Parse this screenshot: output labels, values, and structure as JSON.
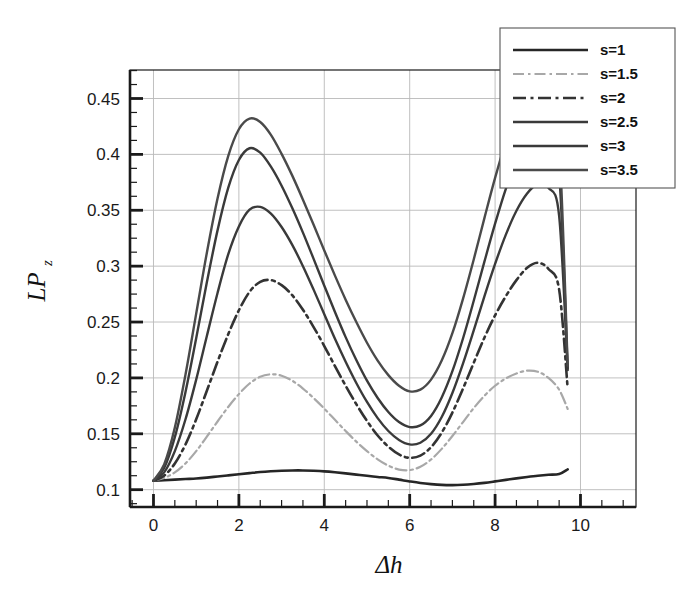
{
  "chart_data": {
    "type": "line",
    "title": "",
    "xlabel": "Δh",
    "ylabel": "LPz",
    "ylabel_base": "LP",
    "ylabel_sub": "z",
    "xlim": [
      -0.55,
      11.3
    ],
    "ylim": [
      0.0845,
      0.4755
    ],
    "xticks": [
      0,
      2,
      4,
      6,
      8,
      10
    ],
    "xtick_labels": [
      "0",
      "2",
      "4",
      "6",
      "8",
      "10"
    ],
    "yticks": [
      0.1,
      0.15,
      0.2,
      0.25,
      0.3,
      0.35,
      0.4,
      0.45
    ],
    "ytick_labels": [
      "0.1",
      "0.15",
      "0.2",
      "0.25",
      "0.3",
      "0.35",
      "0.4",
      "0.45"
    ],
    "x_minor_step": 0.5,
    "y_minor_step": 0.0125,
    "grid": true,
    "grid_color": "#b9b9b9",
    "frame_color": "#1a1a1a",
    "legend_position": "top-right",
    "x": [
      0,
      0.25,
      0.5,
      0.75,
      1,
      1.25,
      1.5,
      1.75,
      2,
      2.25,
      2.5,
      2.75,
      3,
      3.25,
      3.5,
      3.75,
      4,
      4.25,
      4.5,
      4.75,
      5,
      5.25,
      5.5,
      5.75,
      6,
      6.25,
      6.5,
      6.75,
      7,
      7.25,
      7.5,
      7.75,
      8,
      8.25,
      8.5,
      8.75,
      9,
      9.25,
      9.5,
      9.7
    ],
    "series": [
      {
        "name": "s=1",
        "label": "s=1",
        "style": "solid",
        "color": "#262626",
        "width": 2.6,
        "values": [
          0.108,
          0.1085,
          0.109,
          0.1095,
          0.11,
          0.1108,
          0.1118,
          0.1128,
          0.1138,
          0.1148,
          0.1158,
          0.1165,
          0.117,
          0.1172,
          0.1172,
          0.1169,
          0.1164,
          0.1156,
          0.1146,
          0.1135,
          0.1124,
          0.1114,
          0.1105,
          0.109,
          0.1074,
          0.106,
          0.105,
          0.1043,
          0.1041,
          0.1044,
          0.1051,
          0.1061,
          0.1074,
          0.1088,
          0.1101,
          0.1113,
          0.1124,
          0.1133,
          0.114,
          0.1182
        ]
      },
      {
        "name": "s=1.5",
        "label": "s=1.5",
        "style": "dashdot-light",
        "color": "#a8a8a8",
        "width": 2.2,
        "values": [
          0.108,
          0.1105,
          0.1155,
          0.1235,
          0.1345,
          0.1475,
          0.161,
          0.174,
          0.1855,
          0.195,
          0.201,
          0.2032,
          0.202,
          0.1975,
          0.1905,
          0.182,
          0.1725,
          0.1625,
          0.1525,
          0.143,
          0.1345,
          0.1272,
          0.1215,
          0.118,
          0.1175,
          0.1205,
          0.127,
          0.1365,
          0.148,
          0.1605,
          0.173,
          0.184,
          0.193,
          0.1995,
          0.204,
          0.2065,
          0.2055,
          0.2,
          0.1895,
          0.1722
        ]
      },
      {
        "name": "s=2",
        "label": "s=2",
        "style": "dashdot",
        "color": "#333333",
        "width": 2.6,
        "values": [
          0.108,
          0.1125,
          0.1235,
          0.1405,
          0.163,
          0.1885,
          0.2145,
          0.239,
          0.2605,
          0.277,
          0.286,
          0.2875,
          0.283,
          0.274,
          0.261,
          0.2455,
          0.2285,
          0.2105,
          0.193,
          0.1765,
          0.1615,
          0.1485,
          0.1385,
          0.1315,
          0.1285,
          0.1305,
          0.138,
          0.151,
          0.169,
          0.1905,
          0.2135,
          0.236,
          0.256,
          0.273,
          0.2875,
          0.2985,
          0.303,
          0.2975,
          0.279,
          0.1905
        ]
      },
      {
        "name": "s=2.5",
        "label": "s=2.5",
        "style": "solid",
        "color": "#3a3a3a",
        "width": 2.4,
        "values": [
          0.108,
          0.1155,
          0.1345,
          0.163,
          0.1985,
          0.2375,
          0.276,
          0.3105,
          0.3355,
          0.3505,
          0.353,
          0.347,
          0.335,
          0.319,
          0.3,
          0.279,
          0.257,
          0.235,
          0.2145,
          0.1955,
          0.1785,
          0.164,
          0.1525,
          0.1445,
          0.1405,
          0.142,
          0.15,
          0.165,
          0.1865,
          0.213,
          0.2425,
          0.273,
          0.302,
          0.328,
          0.3495,
          0.365,
          0.3735,
          0.37,
          0.345,
          0.207
        ]
      },
      {
        "name": "s=3",
        "label": "s=3",
        "style": "solid",
        "color": "#3a3a3a",
        "width": 2.4,
        "values": [
          0.108,
          0.1195,
          0.147,
          0.1875,
          0.2355,
          0.2855,
          0.332,
          0.37,
          0.395,
          0.4055,
          0.4015,
          0.389,
          0.372,
          0.352,
          0.33,
          0.3065,
          0.2825,
          0.259,
          0.2365,
          0.216,
          0.1975,
          0.182,
          0.1695,
          0.1605,
          0.156,
          0.1575,
          0.166,
          0.1825,
          0.206,
          0.2355,
          0.269,
          0.304,
          0.338,
          0.369,
          0.3945,
          0.413,
          0.4215,
          0.415,
          0.383,
          0.2085
        ]
      },
      {
        "name": "s=3.5",
        "label": "s=3.5",
        "style": "solid",
        "color": "#4a4a4a",
        "width": 2.4,
        "values": [
          0.108,
          0.1225,
          0.1555,
          0.203,
          0.2575,
          0.312,
          0.3605,
          0.3985,
          0.4225,
          0.432,
          0.429,
          0.4175,
          0.4005,
          0.381,
          0.3595,
          0.337,
          0.314,
          0.2915,
          0.27,
          0.25,
          0.2315,
          0.2155,
          0.2025,
          0.193,
          0.188,
          0.1895,
          0.1985,
          0.2155,
          0.24,
          0.271,
          0.306,
          0.343,
          0.379,
          0.411,
          0.4365,
          0.452,
          0.456,
          0.445,
          0.408,
          0.211
        ]
      }
    ]
  },
  "legend": {
    "entries": [
      {
        "label": "s=1"
      },
      {
        "label": "s=1.5"
      },
      {
        "label": "s=2"
      },
      {
        "label": "s=2.5"
      },
      {
        "label": "s=3"
      },
      {
        "label": "s=3.5"
      }
    ]
  }
}
